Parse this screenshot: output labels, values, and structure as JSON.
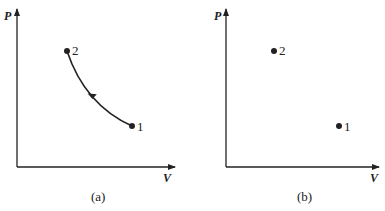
{
  "diagrams": [
    {
      "caption": "(a)",
      "y_axis_label": "P",
      "x_axis_label": "V",
      "points": [
        {
          "label": "1",
          "x": 132,
          "y": 126
        },
        {
          "label": "2",
          "x": 67,
          "y": 51
        }
      ],
      "curve": {
        "from": "1",
        "to": "2",
        "direction_arrow": "toward 2"
      }
    },
    {
      "caption": "(b)",
      "y_axis_label": "P",
      "x_axis_label": "V",
      "points": [
        {
          "label": "1",
          "x": 339,
          "y": 126
        },
        {
          "label": "2",
          "x": 274,
          "y": 51
        }
      ]
    }
  ]
}
